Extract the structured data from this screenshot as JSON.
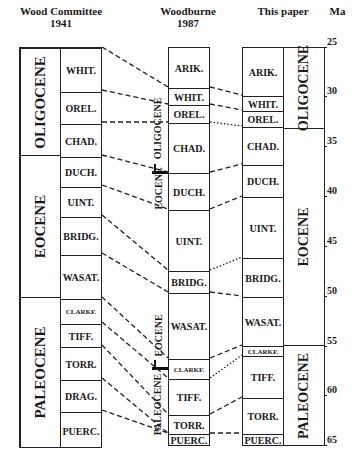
{
  "headers": {
    "wood": "Wood Committee\n1941",
    "wood_line1": "Wood Committee",
    "wood_line2": "1941",
    "woodburne_line1": "Woodburne",
    "woodburne_line2": "1987",
    "this_paper": "This paper",
    "ma": "Ma"
  },
  "wood_1941": {
    "epochs": [
      {
        "label": "OLIGOCENE",
        "top": 47,
        "bottom": 155
      },
      {
        "label": "EOCENE",
        "top": 155,
        "bottom": 297
      },
      {
        "label": "PALEOCENE",
        "top": 297,
        "bottom": 447
      }
    ],
    "stages": [
      {
        "label": "WHIT.",
        "top": 47,
        "bottom": 90
      },
      {
        "label": "OREL.",
        "top": 90,
        "bottom": 122
      },
      {
        "label": "CHAD.",
        "top": 122,
        "bottom": 155
      },
      {
        "label": "DUCH.",
        "top": 155,
        "bottom": 185
      },
      {
        "label": "UINT.",
        "top": 185,
        "bottom": 215
      },
      {
        "label": "BRIDG.",
        "top": 215,
        "bottom": 253
      },
      {
        "label": "WASAT.",
        "top": 253,
        "bottom": 297
      },
      {
        "label": "CLARKF.",
        "top": 297,
        "bottom": 322
      },
      {
        "label": "TIFF.",
        "top": 322,
        "bottom": 345
      },
      {
        "label": "TORR.",
        "top": 345,
        "bottom": 378
      },
      {
        "label": "DRAG.",
        "top": 378,
        "bottom": 410
      },
      {
        "label": "PUERC.",
        "top": 410,
        "bottom": 447
      }
    ]
  },
  "woodburne_1987": {
    "stages": [
      {
        "label": "ARIK.",
        "top": 47,
        "bottom": 87
      },
      {
        "label": "WHIT.",
        "top": 87,
        "bottom": 104
      },
      {
        "label": "OREL.",
        "top": 104,
        "bottom": 122
      },
      {
        "label": "CHAD.",
        "top": 122,
        "bottom": 172
      },
      {
        "label": "DUCH.",
        "top": 172,
        "bottom": 209
      },
      {
        "label": "UINT.",
        "top": 209,
        "bottom": 270
      },
      {
        "label": "BRIDG.",
        "top": 270,
        "bottom": 292
      },
      {
        "label": "WASAT.",
        "top": 292,
        "bottom": 358
      },
      {
        "label": "CLARKF.",
        "top": 358,
        "bottom": 378
      },
      {
        "label": "TIFF.",
        "top": 378,
        "bottom": 414
      },
      {
        "label": "TORR.",
        "top": 414,
        "bottom": 433
      },
      {
        "label": "PUERC.",
        "top": 433,
        "bottom": 445
      }
    ],
    "side_labels": [
      {
        "label": "OLIGOCENE",
        "center": 128
      },
      {
        "label": "EOCENE",
        "center": 188
      },
      {
        "label": "EOCENE",
        "center": 335
      },
      {
        "label": "PALEOCENE",
        "center": 404
      }
    ],
    "boundary_marks": [
      172,
      368
    ]
  },
  "this_paper": {
    "stages": [
      {
        "label": "ARIK.",
        "top": 47,
        "bottom": 95
      },
      {
        "label": "WHIT.",
        "top": 95,
        "bottom": 110
      },
      {
        "label": "OREL.",
        "top": 110,
        "bottom": 126
      },
      {
        "label": "CHAD.",
        "top": 126,
        "bottom": 164
      },
      {
        "label": "DUCH.",
        "top": 164,
        "bottom": 196
      },
      {
        "label": "UINT.",
        "top": 196,
        "bottom": 257
      },
      {
        "label": "BRIDG.",
        "top": 257,
        "bottom": 296
      },
      {
        "label": "WASAT.",
        "top": 296,
        "bottom": 345
      },
      {
        "label": "CLARKF.",
        "top": 345,
        "bottom": 355
      },
      {
        "label": "TIFF.",
        "top": 355,
        "bottom": 397
      },
      {
        "label": "TORR.",
        "top": 397,
        "bottom": 433
      },
      {
        "label": "PUERC.",
        "top": 433,
        "bottom": 445
      }
    ],
    "epochs": [
      {
        "label": "OLIGOCENE",
        "top": 47,
        "bottom": 128
      },
      {
        "label": "EOCENE",
        "top": 128,
        "bottom": 345
      },
      {
        "label": "PALEOCENE",
        "top": 345,
        "bottom": 445
      }
    ]
  },
  "ma_scale": {
    "ticks": [
      {
        "label": "25",
        "y": 47
      },
      {
        "label": "30",
        "y": 96
      },
      {
        "label": "35",
        "y": 146
      },
      {
        "label": "40",
        "y": 196
      },
      {
        "label": "45",
        "y": 246
      },
      {
        "label": "50",
        "y": 296
      },
      {
        "label": "55",
        "y": 346
      },
      {
        "label": "60",
        "y": 395
      },
      {
        "label": "65",
        "y": 445
      }
    ]
  },
  "correlations_wood_to_woodburne": [
    {
      "from": 47,
      "to": 87,
      "style": "dashed"
    },
    {
      "from": 90,
      "to": 104,
      "style": "dashed"
    },
    {
      "from": 122,
      "to": 122,
      "style": "dashed"
    },
    {
      "from": 155,
      "to": 172,
      "style": "dashed"
    },
    {
      "from": 185,
      "to": 209,
      "style": "dashed"
    },
    {
      "from": 215,
      "to": 270,
      "style": "dashed"
    },
    {
      "from": 253,
      "to": 292,
      "style": "dashed"
    },
    {
      "from": 297,
      "to": 358,
      "style": "dashed"
    },
    {
      "from": 322,
      "to": 378,
      "style": "dashed"
    },
    {
      "from": 345,
      "to": 414,
      "style": "dashed"
    },
    {
      "from": 378,
      "to": 433,
      "style": "dashed"
    },
    {
      "from": 410,
      "to": 433,
      "style": "dashed"
    }
  ],
  "correlations_woodburne_to_this": [
    {
      "from": 87,
      "to": 95,
      "style": "dashed"
    },
    {
      "from": 104,
      "to": 110,
      "style": "dashed"
    },
    {
      "from": 122,
      "to": 126,
      "style": "dotted"
    },
    {
      "from": 172,
      "to": 164,
      "style": "dashed"
    },
    {
      "from": 209,
      "to": 196,
      "style": "dashed"
    },
    {
      "from": 270,
      "to": 257,
      "style": "dotted"
    },
    {
      "from": 292,
      "to": 296,
      "style": "dashed"
    },
    {
      "from": 358,
      "to": 345,
      "style": "dashed"
    },
    {
      "from": 378,
      "to": 355,
      "style": "dotted"
    },
    {
      "from": 414,
      "to": 397,
      "style": "dashed"
    },
    {
      "from": 433,
      "to": 433,
      "style": "dashed"
    }
  ]
}
